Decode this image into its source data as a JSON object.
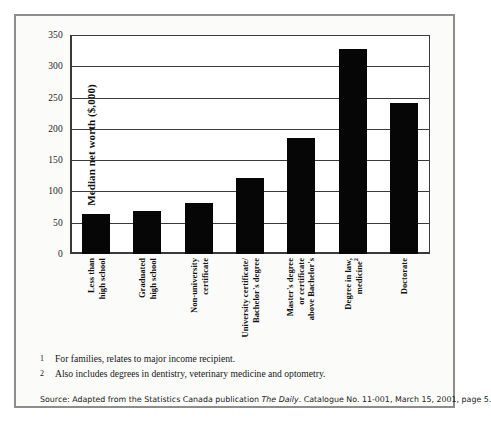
{
  "chart_data": {
    "type": "bar",
    "title": "",
    "xlabel": "",
    "ylabel": "Median net worth ($,000)",
    "ylim": [
      0,
      350
    ],
    "yticks": [
      0,
      50,
      100,
      150,
      200,
      250,
      300,
      350
    ],
    "grid": true,
    "legend": "none",
    "bar_color": "#060606",
    "categories": [
      "Less than high school",
      "Graduated high school",
      "Non-university certificate",
      "University certificate/ Bachelor's degree",
      "Master's degree or certificate above Bachelor's",
      "Degree in law, medicine",
      "Doctorate"
    ],
    "values": [
      64,
      69,
      81,
      121,
      186,
      327,
      242
    ],
    "bars": [
      {
        "label_lines": [
          "Less than",
          "high school"
        ],
        "footnote": "",
        "value": 64
      },
      {
        "label_lines": [
          "Graduated",
          "high school"
        ],
        "footnote": "",
        "value": 69
      },
      {
        "label_lines": [
          "Non-university",
          "certificate"
        ],
        "footnote": "",
        "value": 81
      },
      {
        "label_lines": [
          "University certificate/",
          "Bachelor's degree"
        ],
        "footnote": "",
        "value": 121
      },
      {
        "label_lines": [
          "Master's degree",
          "or certificate",
          "above Bachelor's"
        ],
        "footnote": "",
        "value": 186
      },
      {
        "label_lines": [
          "Degree in law,",
          "medicine"
        ],
        "footnote": "2",
        "value": 327
      },
      {
        "label_lines": [
          "Doctorate"
        ],
        "footnote": "",
        "value": 242
      }
    ]
  },
  "footnotes": [
    {
      "marker": "1",
      "text": "For families, relates to major income recipient."
    },
    {
      "marker": "2",
      "text": "Also includes degrees in dentistry, veterinary medicine and optometry."
    }
  ],
  "source": {
    "prefix": "Source: Adapted from the Statistics Canada publication ",
    "publication": "The Daily",
    "suffix": ". Catalogue No. 11-001, March 15, 2001, page 5."
  }
}
